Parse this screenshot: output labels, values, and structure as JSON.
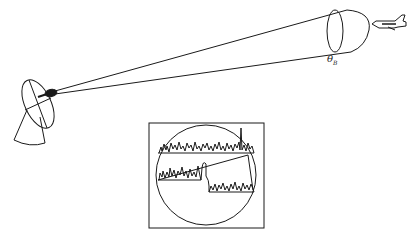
{
  "diagram": {
    "beam_angle_label": "θ",
    "beam_angle_subscript": "B",
    "elements": {
      "antenna": "radar-dish-antenna",
      "beam": "conical-radar-beam",
      "target": "jet-aircraft",
      "scope": "radar-scope-display"
    },
    "colors": {
      "stroke": "#1a1a1a",
      "background": "#ffffff"
    }
  }
}
